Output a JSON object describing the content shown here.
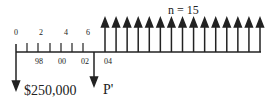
{
  "diagram": {
    "title": "n = 15",
    "top_ticks": [
      "0",
      "2",
      "4",
      "6"
    ],
    "bottom_years": [
      "98",
      "00",
      "02",
      "04"
    ],
    "outflow_1": "$250,000",
    "outflow_2": "P'",
    "up_arrow_count": 15,
    "line_color": "#222222"
  }
}
